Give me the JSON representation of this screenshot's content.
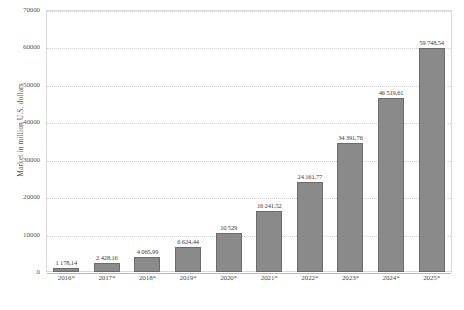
{
  "chart_data": {
    "type": "bar",
    "title": "",
    "xlabel": "",
    "ylabel": "Market in million U.S. dollars",
    "ylim": [
      0,
      70000
    ],
    "yticks": [
      0,
      10000,
      20000,
      30000,
      40000,
      50000,
      60000,
      70000
    ],
    "ytick_labels": [
      "0",
      "10000",
      "20000",
      "30000",
      "40000",
      "50000",
      "60000",
      "70000"
    ],
    "grid": true,
    "legend": "none",
    "bar_color": "#8a8a8a",
    "bar_border_color": "#6b6b6b",
    "categories": [
      "2016*",
      "2017*",
      "2018*",
      "2019*",
      "2020*",
      "2021*",
      "2022*",
      "2023*",
      "2024*",
      "2025*"
    ],
    "values": [
      1178.14,
      2428.16,
      4065.99,
      6624.44,
      10529,
      16241.52,
      24161.77,
      34391.76,
      46519.61,
      59748.54
    ],
    "value_labels": [
      "1 178,14",
      "2 428,16",
      "4 065,99",
      "6 624,44",
      "10 529",
      "16 241,52",
      "24 161,77",
      "34 391,76",
      "46 519,61",
      "59 748,54"
    ]
  }
}
